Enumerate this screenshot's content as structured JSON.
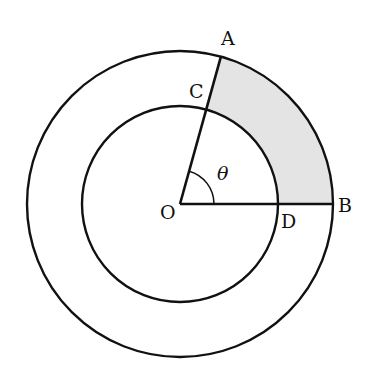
{
  "diagram": {
    "type": "concentric-circles-sector",
    "center": {
      "label": "O",
      "x": 180,
      "y": 204
    },
    "outer_circle": {
      "radius": 153
    },
    "inner_circle": {
      "radius": 98
    },
    "angle": {
      "symbol": "θ",
      "degrees_estimate": 74.5
    },
    "points": {
      "A": {
        "label": "A",
        "on": "outer circle"
      },
      "B": {
        "label": "B",
        "on": "outer circle"
      },
      "C": {
        "label": "C",
        "on": "inner circle"
      },
      "D": {
        "label": "D",
        "on": "inner circle"
      },
      "O": {
        "label": "O",
        "on": "center"
      }
    },
    "segments": [
      "OA",
      "OB"
    ],
    "shaded_region": {
      "description": "annular sector ABDC between inner and outer arcs",
      "fill": "#e4e4e4"
    },
    "colors": {
      "stroke": "#111111",
      "shade": "#e4e4e4",
      "background": "#ffffff"
    }
  }
}
